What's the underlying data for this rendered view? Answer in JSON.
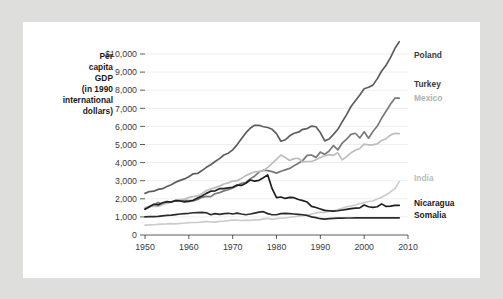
{
  "figure": {
    "background_color": "#dededc",
    "card_color": "#ffffff"
  },
  "axis_title": {
    "lines": [
      "Per",
      "capita",
      "GDP",
      "(in 1990",
      "international",
      "dollars)"
    ]
  },
  "chart_data": {
    "type": "line",
    "title": "",
    "xlabel": "",
    "ylabel": "Per capita GDP (in 1990 international dollars)",
    "xlim": [
      1950,
      2010
    ],
    "ylim": [
      0,
      10000
    ],
    "grid": true,
    "legend_position": "right-inline",
    "y_ticks": [
      0,
      1000,
      2000,
      3000,
      4000,
      5000,
      6000,
      7000,
      8000,
      9000,
      10000
    ],
    "y_tick_labels": [
      "0",
      "1,000",
      "2,000",
      "3,000",
      "4,000",
      "5,000",
      "6,000",
      "7,000",
      "8,000",
      "9,000",
      "$10,000"
    ],
    "x_ticks": [
      1950,
      1960,
      1970,
      1980,
      1990,
      2000,
      2010
    ],
    "x_tick_labels": [
      "1950",
      "1960",
      "1970",
      "1980",
      "1990",
      "2000",
      "2010"
    ],
    "series": [
      {
        "name": "Poland",
        "color": "#5e5e5e",
        "label_color": "#3a3a3a",
        "width": 1.7,
        "label_y": 9950,
        "x": [
          1950,
          1951,
          1952,
          1953,
          1954,
          1955,
          1956,
          1957,
          1958,
          1959,
          1960,
          1961,
          1962,
          1963,
          1964,
          1965,
          1966,
          1967,
          1968,
          1969,
          1970,
          1971,
          1972,
          1973,
          1974,
          1975,
          1976,
          1977,
          1978,
          1979,
          1980,
          1981,
          1982,
          1983,
          1984,
          1985,
          1986,
          1987,
          1988,
          1989,
          1990,
          1991,
          1992,
          1993,
          1994,
          1995,
          1996,
          1997,
          1998,
          1999,
          2000,
          2001,
          2002,
          2003,
          2004,
          2005,
          2006,
          2007,
          2008
        ],
        "values": [
          2300,
          2400,
          2420,
          2520,
          2560,
          2680,
          2780,
          2920,
          3020,
          3100,
          3220,
          3380,
          3400,
          3560,
          3740,
          3880,
          4060,
          4220,
          4420,
          4520,
          4700,
          4980,
          5320,
          5640,
          5900,
          6060,
          6060,
          5980,
          5940,
          5840,
          5600,
          5180,
          5260,
          5480,
          5620,
          5680,
          5840,
          5880,
          6020,
          5980,
          5660,
          5200,
          5300,
          5560,
          5840,
          6260,
          6650,
          7100,
          7420,
          7740,
          8080,
          8160,
          8280,
          8640,
          9060,
          9380,
          9800,
          10300,
          10680
        ]
      },
      {
        "name": "Turkey",
        "color": "#7a7a7a",
        "label_color": "#3a3a3a",
        "width": 1.7,
        "label_y": 8380,
        "x": [
          1950,
          1951,
          1952,
          1953,
          1954,
          1955,
          1956,
          1957,
          1958,
          1959,
          1960,
          1961,
          1962,
          1963,
          1964,
          1965,
          1966,
          1967,
          1968,
          1969,
          1970,
          1971,
          1972,
          1973,
          1974,
          1975,
          1976,
          1977,
          1978,
          1979,
          1980,
          1981,
          1982,
          1983,
          1984,
          1985,
          1986,
          1987,
          1988,
          1989,
          1990,
          1991,
          1992,
          1993,
          1994,
          1995,
          1996,
          1997,
          1998,
          1999,
          2000,
          2001,
          2002,
          2003,
          2004,
          2005,
          2006,
          2007,
          2008
        ],
        "values": [
          1430,
          1560,
          1660,
          1790,
          1700,
          1790,
          1820,
          1900,
          1920,
          1920,
          1900,
          1880,
          1960,
          2080,
          2130,
          2120,
          2280,
          2340,
          2440,
          2500,
          2600,
          2720,
          2860,
          2900,
          3100,
          3250,
          3480,
          3580,
          3560,
          3500,
          3420,
          3520,
          3600,
          3680,
          3820,
          3960,
          4120,
          4400,
          4420,
          4280,
          4580,
          4450,
          4640,
          4940,
          4700,
          5080,
          5300,
          5560,
          5620,
          5360,
          5700,
          5350,
          5720,
          6020,
          6460,
          6840,
          7220,
          7560,
          7560
        ]
      },
      {
        "name": "Mexico",
        "color": "#bdbdbd",
        "label_color": "#b0b0b0",
        "width": 1.7,
        "label_y": 7560,
        "x": [
          1950,
          1951,
          1952,
          1953,
          1954,
          1955,
          1956,
          1957,
          1958,
          1959,
          1960,
          1961,
          1962,
          1963,
          1964,
          1965,
          1966,
          1967,
          1968,
          1969,
          1970,
          1971,
          1972,
          1973,
          1974,
          1975,
          1976,
          1977,
          1978,
          1979,
          1980,
          1981,
          1982,
          1983,
          1984,
          1985,
          1986,
          1987,
          1988,
          1989,
          1990,
          1991,
          1992,
          1993,
          1994,
          1995,
          1996,
          1997,
          1998,
          1999,
          2000,
          2001,
          2002,
          2003,
          2004,
          2005,
          2006,
          2007,
          2008
        ],
        "values": [
          1520,
          1580,
          1600,
          1580,
          1680,
          1760,
          1840,
          1920,
          1960,
          1980,
          2080,
          2120,
          2160,
          2280,
          2460,
          2540,
          2620,
          2700,
          2820,
          2880,
          2980,
          3000,
          3140,
          3280,
          3400,
          3480,
          3520,
          3560,
          3740,
          3960,
          4180,
          4420,
          4280,
          4120,
          4220,
          4240,
          4040,
          4060,
          4060,
          4160,
          4280,
          4380,
          4440,
          4400,
          4540,
          4150,
          4330,
          4540,
          4680,
          4780,
          5020,
          4980,
          4980,
          5040,
          5220,
          5320,
          5520,
          5620,
          5600
        ]
      },
      {
        "name": "India",
        "color": "#cccccc",
        "label_color": "#bdbdbd",
        "width": 1.7,
        "label_y": 3180,
        "x": [
          1950,
          1951,
          1952,
          1953,
          1954,
          1955,
          1956,
          1957,
          1958,
          1959,
          1960,
          1961,
          1962,
          1963,
          1964,
          1965,
          1966,
          1967,
          1968,
          1969,
          1970,
          1971,
          1972,
          1973,
          1974,
          1975,
          1976,
          1977,
          1978,
          1979,
          1980,
          1981,
          1982,
          1983,
          1984,
          1985,
          1986,
          1987,
          1988,
          1989,
          1990,
          1991,
          1992,
          1993,
          1994,
          1995,
          1996,
          1997,
          1998,
          1999,
          2000,
          2001,
          2002,
          2003,
          2004,
          2005,
          2006,
          2007,
          2008
        ],
        "values": [
          550,
          560,
          565,
          585,
          600,
          610,
          630,
          615,
          645,
          650,
          680,
          690,
          690,
          710,
          750,
          720,
          710,
          750,
          760,
          790,
          830,
          820,
          800,
          820,
          810,
          850,
          840,
          890,
          920,
          860,
          900,
          930,
          940,
          980,
          1010,
          1040,
          1070,
          1090,
          1160,
          1210,
          1260,
          1250,
          1300,
          1340,
          1400,
          1480,
          1560,
          1600,
          1660,
          1740,
          1790,
          1850,
          1880,
          1990,
          2090,
          2220,
          2380,
          2560,
          2950
        ]
      },
      {
        "name": "Nicaragua",
        "color": "#1f1f1f",
        "label_color": "#1a1a1a",
        "width": 1.7,
        "label_y": 1800,
        "x": [
          1950,
          1951,
          1952,
          1953,
          1954,
          1955,
          1956,
          1957,
          1958,
          1959,
          1960,
          1961,
          1962,
          1963,
          1964,
          1965,
          1966,
          1967,
          1968,
          1969,
          1970,
          1971,
          1972,
          1973,
          1974,
          1975,
          1976,
          1977,
          1978,
          1979,
          1980,
          1981,
          1982,
          1983,
          1984,
          1985,
          1986,
          1987,
          1988,
          1989,
          1990,
          1991,
          1992,
          1993,
          1994,
          1995,
          1996,
          1997,
          1998,
          1999,
          2000,
          2001,
          2002,
          2003,
          2004,
          2005,
          2006,
          2007,
          2008
        ],
        "values": [
          1420,
          1560,
          1700,
          1660,
          1780,
          1840,
          1820,
          1900,
          1880,
          1830,
          1860,
          1920,
          2040,
          2160,
          2300,
          2420,
          2440,
          2560,
          2560,
          2600,
          2640,
          2760,
          2740,
          2860,
          3040,
          2980,
          3020,
          3160,
          3320,
          2560,
          2060,
          2100,
          2020,
          2080,
          2060,
          1960,
          1900,
          1820,
          1580,
          1520,
          1440,
          1360,
          1340,
          1320,
          1340,
          1380,
          1420,
          1460,
          1480,
          1500,
          1660,
          1560,
          1530,
          1560,
          1720,
          1580,
          1600,
          1640,
          1640
        ]
      },
      {
        "name": "Somalia",
        "color": "#2b2b2b",
        "label_color": "#1a1a1a",
        "width": 1.7,
        "label_y": 1130,
        "x": [
          1950,
          1951,
          1952,
          1953,
          1954,
          1955,
          1956,
          1957,
          1958,
          1959,
          1960,
          1961,
          1962,
          1963,
          1964,
          1965,
          1966,
          1967,
          1968,
          1969,
          1970,
          1971,
          1972,
          1973,
          1974,
          1975,
          1976,
          1977,
          1978,
          1979,
          1980,
          1981,
          1982,
          1983,
          1984,
          1985,
          1986,
          1987,
          1988,
          1989,
          1990,
          1991,
          1992,
          1993,
          1994,
          1995,
          1996,
          1997,
          1998,
          1999,
          2000,
          2001,
          2002,
          2003,
          2004,
          2005,
          2006,
          2007,
          2008
        ],
        "values": [
          1000,
          1010,
          1020,
          1030,
          1060,
          1080,
          1100,
          1130,
          1160,
          1180,
          1200,
          1230,
          1240,
          1250,
          1230,
          1120,
          1180,
          1140,
          1180,
          1200,
          1160,
          1210,
          1160,
          1120,
          1160,
          1210,
          1260,
          1290,
          1180,
          1120,
          1120,
          1180,
          1200,
          1180,
          1160,
          1140,
          1120,
          1080,
          1000,
          960,
          900,
          880,
          900,
          920,
          930,
          930,
          940,
          940,
          950,
          950,
          950,
          950,
          950,
          950,
          950,
          950,
          950,
          950,
          950
        ]
      }
    ]
  }
}
